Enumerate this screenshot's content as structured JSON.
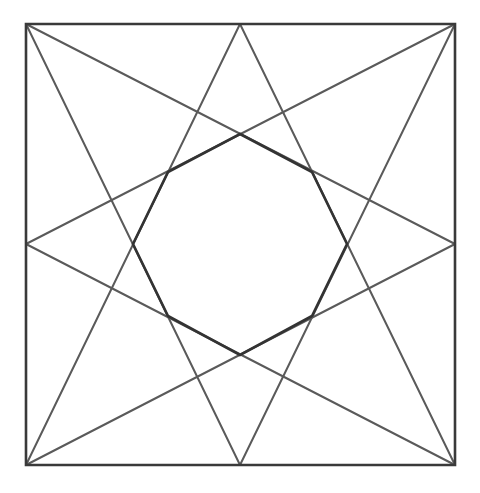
{
  "diagram": {
    "title": "Eight-pointed star inscribed in a square with central octagon",
    "canvas": {
      "width": 480,
      "height": 493,
      "background": "#ffffff"
    },
    "colors": {
      "square_stroke": "#3a3a3a",
      "star_stroke": "#5a5a5a",
      "octagon_stroke": "#333333"
    },
    "stroke_widths": {
      "square": 2.6,
      "star": 2.0,
      "octagon": 2.6
    },
    "square": {
      "corners": {
        "top_left": [
          26,
          24
        ],
        "top_right": [
          455,
          24
        ],
        "bottom_right": [
          455,
          465
        ],
        "bottom_left": [
          26,
          465
        ]
      },
      "midpoints": {
        "top": [
          240,
          24
        ],
        "right": [
          455,
          244
        ],
        "bottom": [
          240,
          465
        ],
        "left": [
          26,
          244
        ]
      }
    },
    "star_lines": [
      {
        "name": "top-left-to-right-mid",
        "from": [
          26,
          24
        ],
        "to": [
          455,
          244
        ]
      },
      {
        "name": "top-left-to-bottom-mid",
        "from": [
          26,
          24
        ],
        "to": [
          240,
          465
        ]
      },
      {
        "name": "top-right-to-left-mid",
        "from": [
          455,
          24
        ],
        "to": [
          26,
          244
        ]
      },
      {
        "name": "top-right-to-bottom-mid",
        "from": [
          455,
          24
        ],
        "to": [
          240,
          465
        ]
      },
      {
        "name": "bottom-left-to-top-mid",
        "from": [
          26,
          465
        ],
        "to": [
          240,
          24
        ]
      },
      {
        "name": "bottom-left-to-right-mid",
        "from": [
          26,
          465
        ],
        "to": [
          455,
          244
        ]
      },
      {
        "name": "bottom-right-to-top-mid",
        "from": [
          455,
          465
        ],
        "to": [
          240,
          24
        ]
      },
      {
        "name": "bottom-right-to-left-mid",
        "from": [
          455,
          465
        ],
        "to": [
          26,
          244
        ]
      }
    ],
    "octagon": {
      "vertices": [
        [
          240,
          134
        ],
        [
          312,
          172
        ],
        [
          347,
          244
        ],
        [
          312,
          316
        ],
        [
          240,
          355
        ],
        [
          168,
          316
        ],
        [
          133,
          244
        ],
        [
          168,
          172
        ]
      ]
    }
  }
}
